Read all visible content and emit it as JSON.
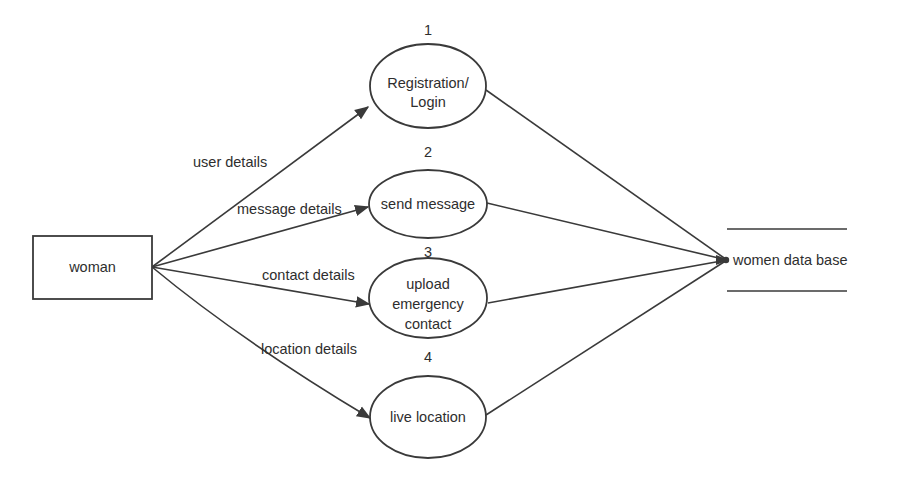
{
  "diagram": {
    "type": "data-flow-diagram",
    "external_entity": {
      "label": "woman"
    },
    "processes": [
      {
        "number": "1",
        "lines": [
          "Registration/",
          "Login"
        ]
      },
      {
        "number": "2",
        "lines": [
          "send message"
        ]
      },
      {
        "number": "3",
        "lines": [
          "upload",
          "emergency",
          "contact"
        ]
      },
      {
        "number": "4",
        "lines": [
          "live location"
        ]
      }
    ],
    "data_store": {
      "label": "women data base"
    },
    "flows": [
      {
        "from": "woman",
        "to": "1",
        "label": "user details"
      },
      {
        "from": "woman",
        "to": "2",
        "label": "message details"
      },
      {
        "from": "woman",
        "to": "3",
        "label": "contact details"
      },
      {
        "from": "woman",
        "to": "4",
        "label": "location details"
      },
      {
        "from": "1",
        "to": "women data base",
        "label": ""
      },
      {
        "from": "2",
        "to": "women data base",
        "label": ""
      },
      {
        "from": "3",
        "to": "women data base",
        "label": ""
      },
      {
        "from": "4",
        "to": "women data base",
        "label": ""
      }
    ],
    "colors": {
      "stroke": "#3a3a3a",
      "text": "#2e2e2e",
      "background": "#ffffff"
    }
  }
}
